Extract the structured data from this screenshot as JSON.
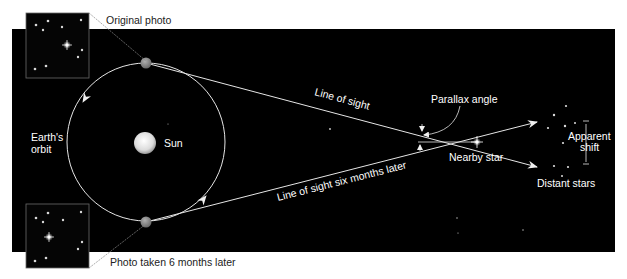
{
  "labels": {
    "original_photo": "Original photo",
    "photo_later": "Photo taken 6 months later",
    "earths_orbit_line1": "Earth's",
    "earths_orbit_line2": "orbit",
    "sun": "Sun",
    "line_of_sight": "Line of sight",
    "line_of_sight_later": "Line of sight six months later",
    "parallax_angle": "Parallax angle",
    "nearby_star": "Nearby star",
    "apparent_shift_line1": "Apparent",
    "apparent_shift_line2": "shift",
    "distant_stars": "Distant stars"
  },
  "colors": {
    "background": "#000000",
    "page": "#ffffff",
    "line": "#e6e6e6",
    "earth": "#8a8a8a",
    "sun": "#e8e8e8",
    "text_light": "#ffffff",
    "text_dark": "#222222"
  }
}
